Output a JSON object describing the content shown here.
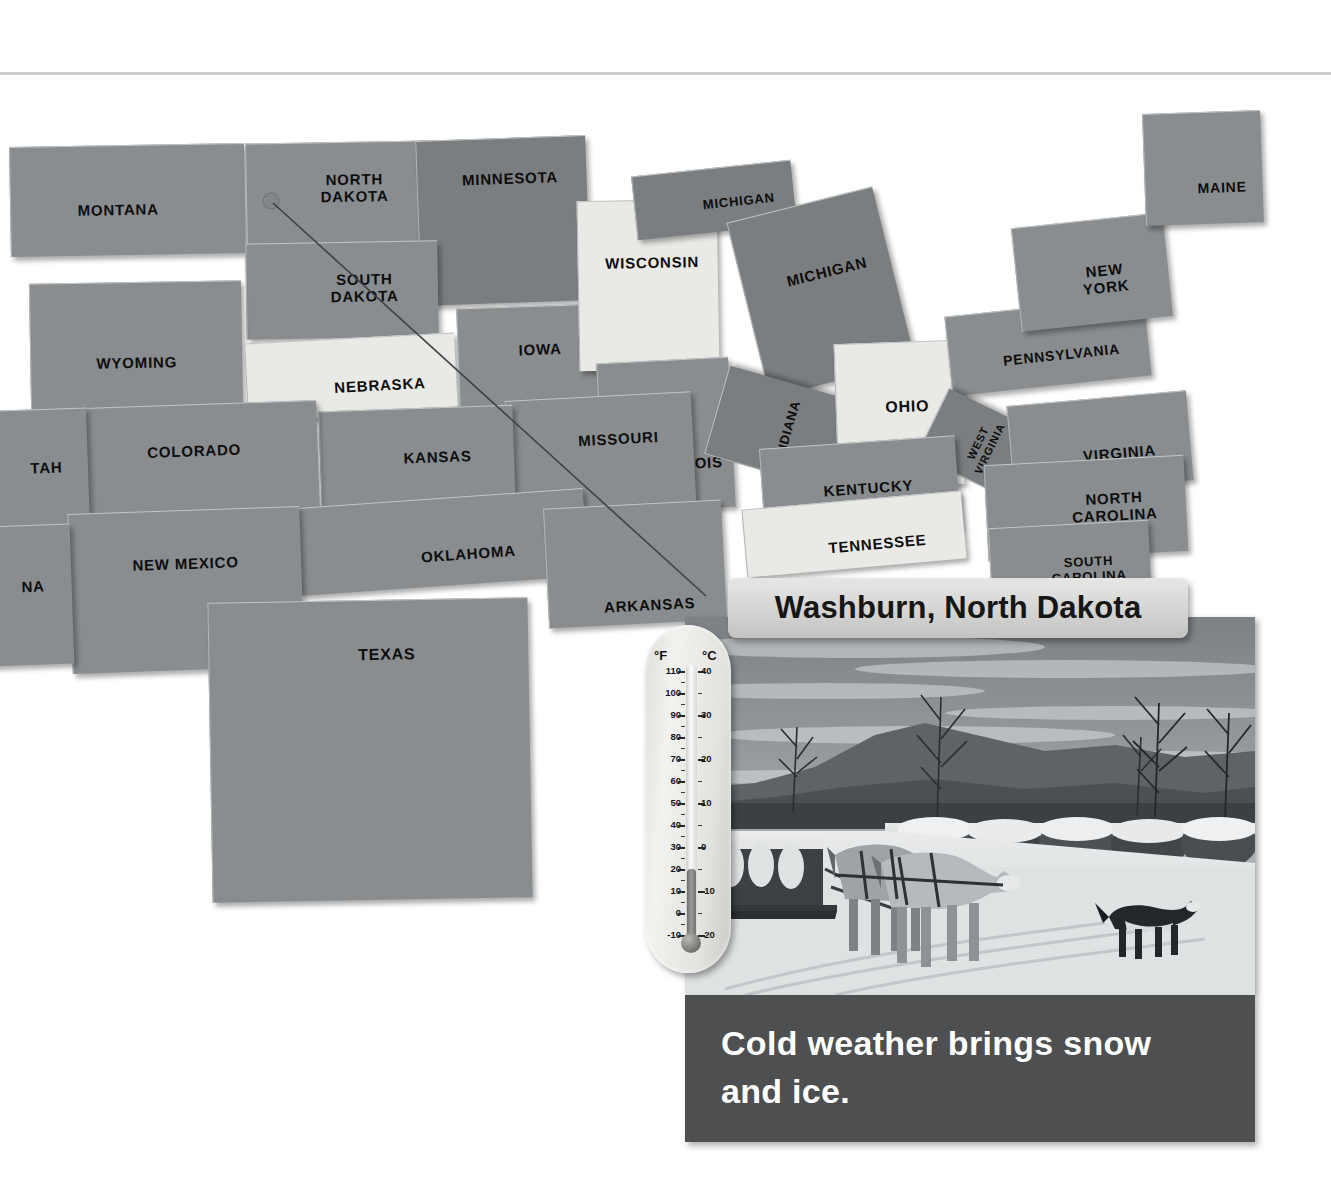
{
  "page": {
    "kind": "textbook-page",
    "background_color": "#ffffff",
    "rule_color": "#c9cbcd"
  },
  "map": {
    "name": "united-states-puzzle-map",
    "style": "grayscale foam puzzle pieces",
    "piece_colors": {
      "dark": "#7b7e80",
      "mid": "#858889",
      "base": "#8a8d8f",
      "light": "#e9e9e6"
    },
    "pointer": {
      "from_state": "NORTH DAKOTA",
      "to": "photo-callout",
      "color": "#3a3a3a"
    },
    "states": [
      {
        "label": "MONTANA",
        "tone": "base",
        "x": 10,
        "y": 85,
        "w": 235,
        "h": 110,
        "fs": 15,
        "rot": -1,
        "skew": 0,
        "tx": -10,
        "ty": 10
      },
      {
        "label": "NORTH\nDAKOTA",
        "tone": "base",
        "x": 246,
        "y": 82,
        "w": 180,
        "h": 100,
        "fs": 15,
        "rot": -1,
        "skew": 0,
        "tx": 18,
        "ty": -4
      },
      {
        "label": "MINNESOTA",
        "tone": "dark",
        "x": 418,
        "y": 78,
        "w": 170,
        "h": 165,
        "fs": 15,
        "rot": -2,
        "skew": 0,
        "tx": 8,
        "ty": -42
      },
      {
        "label": "SOUTH\nDAKOTA",
        "tone": "base",
        "x": 246,
        "y": 182,
        "w": 192,
        "h": 96,
        "fs": 15,
        "rot": -1,
        "skew": 0,
        "tx": 22,
        "ty": -2
      },
      {
        "label": "WYOMING",
        "tone": "base",
        "x": 30,
        "y": 222,
        "w": 212,
        "h": 126,
        "fs": 15,
        "rot": -1,
        "skew": 0,
        "tx": 0,
        "ty": 18
      },
      {
        "label": "NEBRASKA",
        "tone": "light",
        "x": 246,
        "y": 278,
        "w": 210,
        "h": 78,
        "fs": 15,
        "rot": -3,
        "skew": 0,
        "tx": 28,
        "ty": 10
      },
      {
        "label": "IOWA",
        "tone": "base",
        "x": 458,
        "y": 246,
        "w": 148,
        "h": 104,
        "fs": 15,
        "rot": -2,
        "skew": 0,
        "tx": 8,
        "ty": -8
      },
      {
        "label": "WISCONSIN",
        "tone": "light",
        "x": 578,
        "y": 140,
        "w": 140,
        "h": 170,
        "fs": 15,
        "rot": -1,
        "skew": 0,
        "tx": 4,
        "ty": -22
      },
      {
        "label": "MICHIGAN",
        "tone": "dark",
        "x": 634,
        "y": 108,
        "w": 160,
        "h": 64,
        "fs": 13,
        "rot": -6,
        "skew": 0,
        "tx": 24,
        "ty": 4
      },
      {
        "label": "MICHIGAN",
        "tone": "dark",
        "x": 746,
        "y": 142,
        "w": 150,
        "h": 180,
        "fs": 15,
        "rot": -14,
        "skew": 0,
        "tx": 10,
        "ty": -18
      },
      {
        "label": "ILLINOIS",
        "tone": "base",
        "x": 600,
        "y": 300,
        "w": 132,
        "h": 150,
        "fs": 15,
        "rot": -3,
        "skew": 0,
        "tx": 20,
        "ty": 30
      },
      {
        "label": "INDIANA",
        "tone": "dark",
        "x": 742,
        "y": 296,
        "w": 92,
        "h": 148,
        "fs": 13,
        "rot": -74,
        "skew": 0,
        "tx": 0,
        "ty": 0
      },
      {
        "label": "OHIO",
        "tone": "light",
        "x": 836,
        "y": 282,
        "w": 126,
        "h": 144,
        "fs": 16,
        "rot": -2,
        "skew": 0,
        "tx": 8,
        "ty": -8
      },
      {
        "label": "PENNSYLVANIA",
        "tone": "base",
        "x": 948,
        "y": 246,
        "w": 200,
        "h": 80,
        "fs": 14,
        "rot": -6,
        "skew": 0,
        "tx": 12,
        "ty": 10
      },
      {
        "label": "NEW\nYORK",
        "tone": "base",
        "x": 1016,
        "y": 160,
        "w": 152,
        "h": 104,
        "fs": 15,
        "rot": -6,
        "skew": 0,
        "tx": 12,
        "ty": 8
      },
      {
        "label": "MAINE",
        "tone": "base",
        "x": 1144,
        "y": 52,
        "w": 118,
        "h": 112,
        "fs": 14,
        "rot": -2,
        "skew": 0,
        "tx": 18,
        "ty": 20
      },
      {
        "label": "WEST\nVIRGINIA",
        "tone": "dark",
        "x": 946,
        "y": 330,
        "w": 74,
        "h": 112,
        "fs": 11,
        "rot": -64,
        "skew": 0,
        "tx": 0,
        "ty": 0
      },
      {
        "label": "VIRGINIA",
        "tone": "base",
        "x": 1010,
        "y": 338,
        "w": 180,
        "h": 90,
        "fs": 15,
        "rot": -5,
        "skew": 0,
        "tx": 18,
        "ty": 12
      },
      {
        "label": "KENTUCKY",
        "tone": "base",
        "x": 762,
        "y": 382,
        "w": 196,
        "h": 94,
        "fs": 15,
        "rot": -4,
        "skew": 0,
        "tx": 8,
        "ty": 0
      },
      {
        "label": "TENNESSEE",
        "tone": "light",
        "x": 744,
        "y": 440,
        "w": 220,
        "h": 68,
        "fs": 15,
        "rot": -5,
        "skew": 0,
        "tx": 22,
        "ty": 12
      },
      {
        "label": "NORTH\nCAROLINA",
        "tone": "base",
        "x": 986,
        "y": 400,
        "w": 200,
        "h": 96,
        "fs": 15,
        "rot": -3,
        "skew": 0,
        "tx": 28,
        "ty": 0
      },
      {
        "label": "SOUTH\nCAROLINA",
        "tone": "base",
        "x": 990,
        "y": 464,
        "w": 160,
        "h": 76,
        "fs": 13,
        "rot": -3,
        "skew": 0,
        "tx": 18,
        "ty": 8
      },
      {
        "label": "MISSOURI",
        "tone": "base",
        "x": 508,
        "y": 336,
        "w": 186,
        "h": 128,
        "fs": 15,
        "rot": -3,
        "skew": 0,
        "tx": 18,
        "ty": -20
      },
      {
        "label": "KANSAS",
        "tone": "base",
        "x": 320,
        "y": 348,
        "w": 194,
        "h": 96,
        "fs": 15,
        "rot": -2,
        "skew": 0,
        "tx": 20,
        "ty": 2
      },
      {
        "label": "COLORADO",
        "tone": "base",
        "x": 86,
        "y": 344,
        "w": 232,
        "h": 110,
        "fs": 15,
        "rot": -2,
        "skew": 0,
        "tx": -8,
        "ty": -8
      },
      {
        "label": "TAH",
        "tone": "base",
        "x": -52,
        "y": 350,
        "w": 140,
        "h": 118,
        "fs": 15,
        "rot": -2,
        "skew": 0,
        "tx": 28,
        "ty": 0
      },
      {
        "label": "OKLAHOMA",
        "tone": "base",
        "x": 296,
        "y": 438,
        "w": 290,
        "h": 88,
        "fs": 15,
        "rot": -4,
        "skew": 0,
        "tx": 26,
        "ty": 14
      },
      {
        "label": "ARKANSAS",
        "tone": "base",
        "x": 546,
        "y": 444,
        "w": 178,
        "h": 120,
        "fs": 15,
        "rot": -3,
        "skew": 0,
        "tx": 12,
        "ty": 42
      },
      {
        "label": "NEW MEXICO",
        "tone": "base",
        "x": 70,
        "y": 450,
        "w": 232,
        "h": 160,
        "fs": 15,
        "rot": -2,
        "skew": 0,
        "tx": 0,
        "ty": -26
      },
      {
        "label": "NA",
        "tone": "base",
        "x": -70,
        "y": 466,
        "w": 142,
        "h": 140,
        "fs": 15,
        "rot": -2,
        "skew": 0,
        "tx": 32,
        "ty": -8
      },
      {
        "label": "TEXAS",
        "tone": "base",
        "x": 210,
        "y": 540,
        "w": 320,
        "h": 300,
        "fs": 16,
        "rot": -1,
        "skew": 0,
        "tx": 18,
        "ty": -96
      }
    ]
  },
  "callout": {
    "place_name": "Washburn, North Dakota",
    "caption": "Cold weather brings snow and ice.",
    "photo_alt": "Horses pulling a sleigh on a snowy road past snow-covered round hay bales, a black-and-white dog walking nearby, bare trees and hills in the background.",
    "caption_bg": "#4d4f51",
    "caption_color": "#ffffff"
  },
  "thermometer": {
    "name": "dual-scale-thermometer",
    "fahrenheit_unit": "°F",
    "celsius_unit": "°C",
    "fahrenheit_labels": [
      "110",
      "100",
      "90",
      "80",
      "70",
      "60",
      "50",
      "40",
      "30",
      "20",
      "10",
      "0",
      "-10"
    ],
    "celsius_labels": [
      "40",
      "30",
      "20",
      "10",
      "0",
      "-10",
      "-20"
    ],
    "reading_f": 20,
    "reading_c": -7,
    "f_range": [
      -10,
      110
    ],
    "c_range": [
      -20,
      40
    ]
  }
}
